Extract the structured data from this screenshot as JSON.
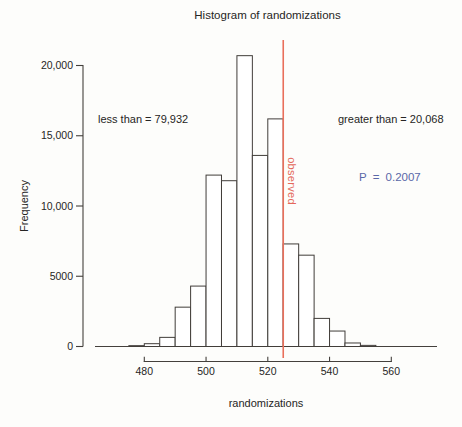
{
  "title": "Histogram of randomizations",
  "axes": {
    "x_label": "randomizations",
    "y_label": "Frequency"
  },
  "annotations": {
    "less_than": "less than = 79,932",
    "greater_than": "greater than = 20,068",
    "p_value": "P = 0.2007",
    "observed": "observed"
  },
  "colors": {
    "background": "#fdfdfb",
    "text": "#262524",
    "axis_stroke": "#44403c",
    "bar_stroke": "#413d39",
    "bar_fill": "#ffffff",
    "observed_line": "#e96f5b",
    "observed_text": "#e4685a",
    "p_value_text": "#5a68a8"
  },
  "chart_data": {
    "type": "bar",
    "subtype": "histogram",
    "title": "Histogram of randomizations",
    "xlabel": "randomizations",
    "ylabel": "Frequency",
    "grid": false,
    "legend": null,
    "bin_width": 5,
    "bin_edges": [
      475,
      480,
      485,
      490,
      495,
      500,
      505,
      510,
      515,
      520,
      525,
      530,
      535,
      540,
      545,
      550,
      555
    ],
    "frequencies": [
      60,
      200,
      650,
      2800,
      4300,
      12200,
      11800,
      20700,
      13600,
      16200,
      7300,
      6500,
      2000,
      1100,
      250,
      80
    ],
    "x_ticks": [
      480,
      500,
      520,
      540,
      560
    ],
    "x_tick_labels": [
      "480",
      "500",
      "520",
      "540",
      "560"
    ],
    "y_ticks": [
      0,
      5000,
      10000,
      15000,
      20000
    ],
    "y_tick_labels": [
      "0",
      "5000",
      "10,000",
      "15,000",
      "20,000"
    ],
    "xlim": [
      468,
      575
    ],
    "ylim": [
      0,
      20000
    ],
    "observed_value": 525,
    "total_randomizations": 100000,
    "count_less_than": 79932,
    "count_greater_than": 20068,
    "p_value": 0.2007
  }
}
